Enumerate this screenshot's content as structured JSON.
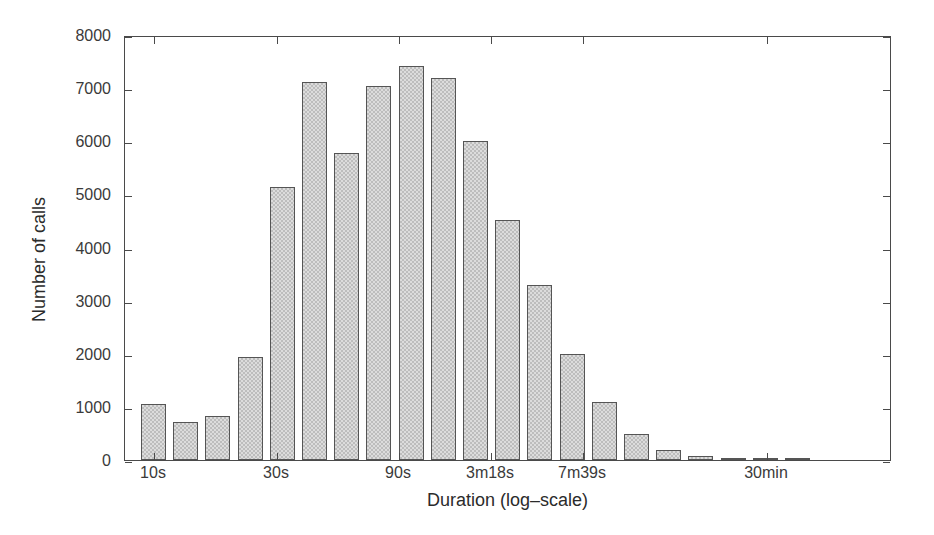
{
  "chart_data": {
    "type": "bar",
    "title": "",
    "xlabel": "Duration (log–scale)",
    "ylabel": "Number of calls",
    "ylim": [
      0,
      8000
    ],
    "grid": false,
    "legend": null,
    "y_ticks": [
      0,
      1000,
      2000,
      3000,
      4000,
      5000,
      6000,
      7000,
      8000
    ],
    "y_tick_labels": [
      "0",
      "1000",
      "2000",
      "3000",
      "4000",
      "5000",
      "6000",
      "7000",
      "8000"
    ],
    "x_tick_labels": [
      "10s",
      "30s",
      "90s",
      "3m18s",
      "7m39s",
      "30min"
    ],
    "x_tick_positions_px": [
      153,
      276,
      398,
      490,
      582,
      766
    ],
    "bin_count": 21,
    "values": [
      1050,
      720,
      820,
      1940,
      5130,
      7120,
      5770,
      7040,
      7420,
      7200,
      6010,
      4520,
      3300,
      2000,
      1100,
      490,
      190,
      70,
      25,
      8,
      3
    ]
  },
  "axes": {
    "x_title": "Duration (log–scale)",
    "y_title": "Number of calls"
  },
  "style": {
    "bar_fill": "#dcdcdc",
    "bar_stroke": "#555555",
    "axis_color": "#4a4a4a",
    "text_color": "#2b2b2b",
    "background": "#ffffff"
  }
}
